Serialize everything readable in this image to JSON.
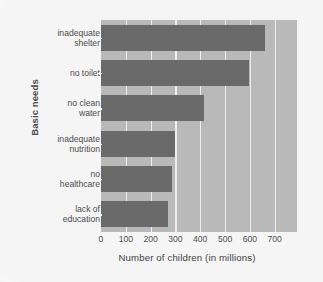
{
  "chart_data": {
    "type": "bar",
    "orientation": "horizontal",
    "title": "",
    "xlabel": "Number of children (in millions)",
    "ylabel": "Basic needs",
    "categories": [
      "inadequate shelter",
      "no toilet",
      "no clean water",
      "inadequate nutrition",
      "no healthcare",
      "lack of education"
    ],
    "category_lines": [
      [
        "inadequate",
        "shelter"
      ],
      [
        "no toilet"
      ],
      [
        "no clean",
        "water"
      ],
      [
        "inadequate",
        "nutrition"
      ],
      [
        "no",
        "healthcare"
      ],
      [
        "lack of",
        "education"
      ]
    ],
    "values": [
      660,
      595,
      415,
      300,
      285,
      270
    ],
    "xlim": [
      0,
      790
    ],
    "xticks": [
      0,
      100,
      200,
      300,
      400,
      500,
      600,
      700
    ],
    "xticklabels": [
      "0",
      "100",
      "200",
      "300",
      "400",
      "500",
      "600",
      "700"
    ],
    "grid": true,
    "grid_axis": "x",
    "grid_color": "#eeeeee",
    "legend": false,
    "colors": {
      "bar": "#6a6a6a",
      "plot_background": "#b9b9b9",
      "page_background": "#fbfbfb",
      "text": "#4d4d4d"
    }
  }
}
